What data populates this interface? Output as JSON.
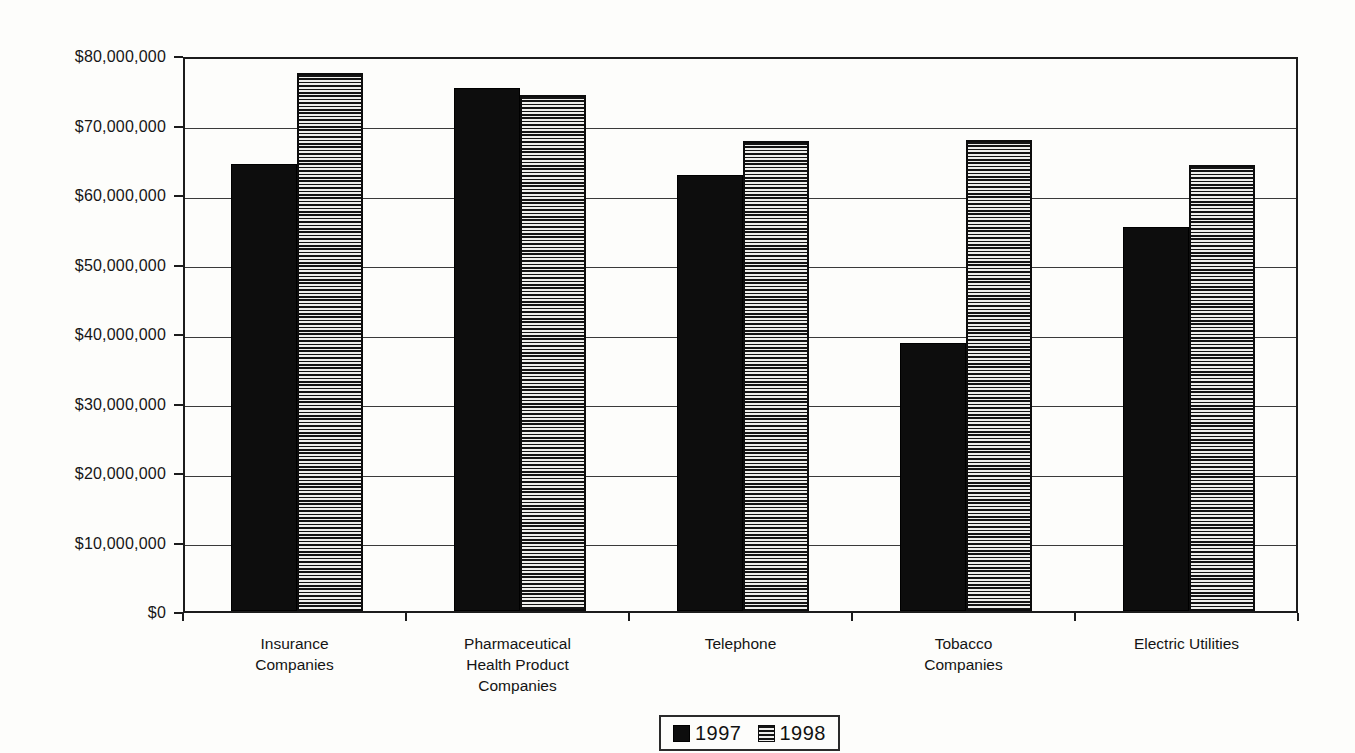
{
  "chart_data": {
    "type": "bar",
    "title": "",
    "xlabel": "",
    "ylabel": "",
    "categories": [
      "Insurance Companies",
      "Pharmaceutical Health Product Companies",
      "Telephone",
      "Tobacco Companies",
      "Electric Utilities"
    ],
    "category_lines": [
      [
        "Insurance",
        "Companies"
      ],
      [
        "Pharmaceutical",
        "Health Product",
        "Companies"
      ],
      [
        "Telephone"
      ],
      [
        "Tobacco",
        "Companies"
      ],
      [
        "Electric Utilities"
      ]
    ],
    "series": [
      {
        "name": "1997",
        "pattern": "solid-black",
        "values": [
          64300000,
          75200000,
          62700000,
          38600000,
          55300000
        ]
      },
      {
        "name": "1998",
        "pattern": "horizontal-stripes",
        "values": [
          77400000,
          74200000,
          67700000,
          67800000,
          64200000
        ]
      }
    ],
    "ylim": [
      0,
      80000000
    ],
    "ytick_interval": 10000000,
    "ytick_labels": [
      "$0",
      "$10,000,000",
      "$20,000,000",
      "$30,000,000",
      "$40,000,000",
      "$50,000,000",
      "$60,000,000",
      "$70,000,000",
      "$80,000,000"
    ],
    "grid": "horizontal",
    "legend_position": "bottom-center",
    "colors": {
      "bar_1997": "#0d0d0d",
      "stripe_dark": "#141414",
      "stripe_light": "#efefec",
      "axis": "#1c1c1c",
      "background": "#fdfdfb"
    }
  },
  "legend": {
    "items": [
      {
        "label": "1997"
      },
      {
        "label": "1998"
      }
    ]
  }
}
